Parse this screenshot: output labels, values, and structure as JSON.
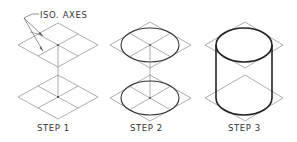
{
  "figure": {
    "title_callout": "ISO. AXES",
    "steps": [
      {
        "label": "STEP 1",
        "description": "two isometric squares with iso axes, centers joined by vertical axis"
      },
      {
        "label": "STEP 2",
        "description": "ellipses inscribed in isometric squares"
      },
      {
        "label": "STEP 3",
        "description": "cylinder completed by tangent vertical lines"
      }
    ]
  },
  "colors": {
    "construction": "#8a8a8a",
    "object": "#222222",
    "text": "#333333",
    "background": "#ffffff"
  }
}
